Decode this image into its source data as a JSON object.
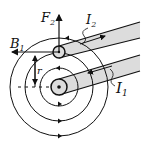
{
  "diagram": {
    "type": "physics-magnetic-field-between-parallel-wires",
    "labels": {
      "force": "F",
      "force_sub": "2",
      "field": "B",
      "field_sub": "1",
      "current2": "I",
      "current2_sub": "2",
      "current1": "I",
      "current1_sub": "1",
      "radius": "r"
    },
    "colors": {
      "line": "#111111",
      "wire_fill": "#dcdcdc",
      "background": "#ffffff"
    },
    "field_circles": [
      19,
      34,
      49
    ]
  }
}
